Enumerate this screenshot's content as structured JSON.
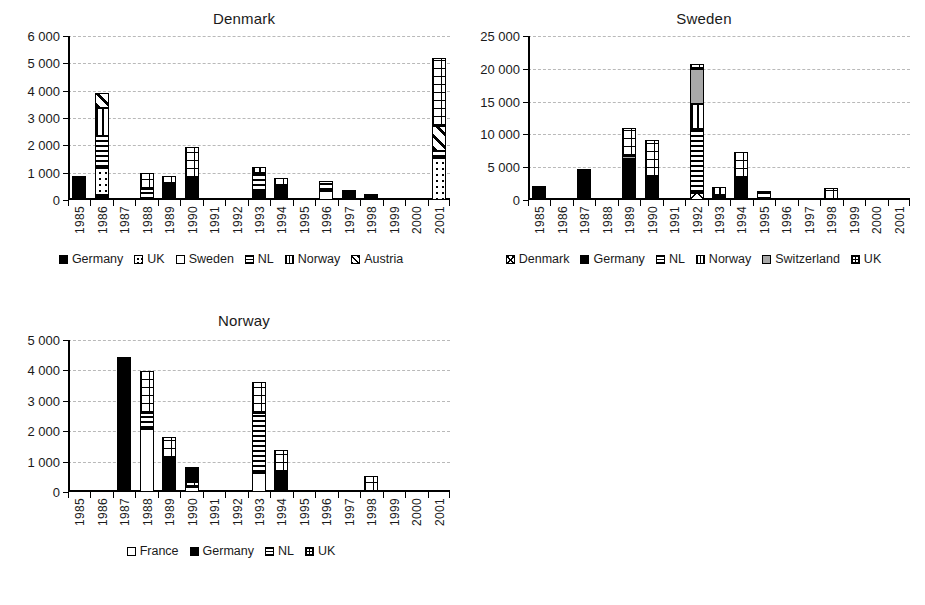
{
  "page": {
    "background": "#ffffff",
    "ink": "#1a1a1a",
    "gridline_color": "#b9b9b9",
    "gray_fill": "#a8a8a8"
  },
  "patterns": {
    "solid": "black-solid",
    "white": "white-empty",
    "gray": "gray-solid",
    "dots": "white-with-dots",
    "horiz": "horizontal-lines",
    "vert": "vertical-lines",
    "grid": "cross-grid",
    "diag": "diagonal-hatch",
    "diamond": "diamond-hatch"
  },
  "chart_data": [
    {
      "id": "denmark",
      "type": "bar",
      "stacked": true,
      "title": "Denmark",
      "xlabel": "",
      "ylabel": "",
      "ylim": [
        0,
        6000
      ],
      "yticks": [
        0,
        1000,
        2000,
        3000,
        4000,
        5000,
        6000
      ],
      "ytick_labels": [
        "0",
        "1 000",
        "2 000",
        "3 000",
        "4 000",
        "5 000",
        "6 000"
      ],
      "grid": true,
      "legend_position": "bottom",
      "categories": [
        "1985",
        "1986",
        "1987",
        "1988",
        "1989",
        "1990",
        "1991",
        "1992",
        "1993",
        "1994",
        "1995",
        "1996",
        "1997",
        "1998",
        "1999",
        "2000",
        "2001"
      ],
      "series": [
        {
          "name": "Germany",
          "pattern": "solid",
          "values": [
            880,
            180,
            0,
            0,
            590,
            800,
            0,
            0,
            290,
            500,
            0,
            0,
            280,
            130,
            0,
            0,
            0
          ]
        },
        {
          "name": "UK",
          "pattern": "dots",
          "values": [
            0,
            990,
            0,
            0,
            0,
            0,
            0,
            0,
            0,
            0,
            0,
            0,
            70,
            30,
            0,
            0,
            1520
          ]
        },
        {
          "name": "Sweden",
          "pattern": "white",
          "values": [
            0,
            0,
            0,
            0,
            0,
            0,
            0,
            0,
            0,
            0,
            0,
            320,
            0,
            0,
            0,
            0,
            0
          ]
        },
        {
          "name": "NL",
          "pattern": "horiz",
          "values": [
            0,
            1180,
            0,
            400,
            0,
            0,
            0,
            0,
            700,
            0,
            0,
            390,
            0,
            0,
            0,
            0,
            280
          ]
        },
        {
          "name": "Norway",
          "pattern": "vert",
          "values": [
            0,
            1000,
            0,
            0,
            0,
            0,
            0,
            0,
            210,
            0,
            0,
            0,
            0,
            0,
            0,
            0,
            0
          ]
        },
        {
          "name": "Austria",
          "pattern": "diag",
          "values": [
            0,
            580,
            0,
            0,
            0,
            0,
            0,
            0,
            0,
            0,
            0,
            0,
            0,
            0,
            0,
            0,
            900
          ]
        },
        {
          "name": "Other-grid",
          "pattern": "grid",
          "values": [
            0,
            0,
            0,
            600,
            300,
            1150,
            0,
            0,
            0,
            300,
            0,
            0,
            0,
            0,
            0,
            0,
            2500
          ]
        }
      ],
      "legend": [
        {
          "label": "Germany",
          "pattern": "solid"
        },
        {
          "label": "UK",
          "pattern": "dots"
        },
        {
          "label": "Sweden",
          "pattern": "white"
        },
        {
          "label": "NL",
          "pattern": "horiz"
        },
        {
          "label": "Norway",
          "pattern": "vert"
        },
        {
          "label": "Austria",
          "pattern": "diag"
        }
      ]
    },
    {
      "id": "sweden",
      "type": "bar",
      "stacked": true,
      "title": "Sweden",
      "xlabel": "",
      "ylabel": "",
      "ylim": [
        0,
        25000
      ],
      "yticks": [
        0,
        5000,
        10000,
        15000,
        20000,
        25000
      ],
      "ytick_labels": [
        "0",
        "5 000",
        "10 000",
        "15 000",
        "20 000",
        "25 000"
      ],
      "grid": true,
      "legend_position": "bottom",
      "categories": [
        "1985",
        "1986",
        "1987",
        "1988",
        "1989",
        "1990",
        "1991",
        "1992",
        "1993",
        "1994",
        "1995",
        "1996",
        "1997",
        "1998",
        "1999",
        "2000",
        "2001"
      ],
      "series": [
        {
          "name": "Denmark",
          "pattern": "diamond",
          "values": [
            0,
            0,
            0,
            0,
            0,
            0,
            0,
            1100,
            0,
            0,
            0,
            0,
            0,
            0,
            0,
            0,
            0
          ]
        },
        {
          "name": "Germany",
          "pattern": "solid",
          "values": [
            2200,
            0,
            4700,
            0,
            6300,
            3500,
            0,
            0,
            800,
            3300,
            0,
            0,
            0,
            0,
            0,
            0,
            0
          ]
        },
        {
          "name": "NL",
          "pattern": "horiz",
          "values": [
            0,
            0,
            0,
            0,
            0,
            0,
            0,
            9800,
            0,
            0,
            1400,
            0,
            0,
            0,
            0,
            0,
            0
          ]
        },
        {
          "name": "Norway",
          "pattern": "vert",
          "values": [
            0,
            0,
            0,
            0,
            0,
            0,
            0,
            3700,
            1200,
            0,
            0,
            0,
            0,
            0,
            0,
            0,
            0
          ]
        },
        {
          "name": "Switzerland",
          "pattern": "gray",
          "values": [
            0,
            0,
            0,
            0,
            400,
            0,
            0,
            5300,
            0,
            0,
            0,
            0,
            0,
            0,
            0,
            0,
            0
          ]
        },
        {
          "name": "UK",
          "pattern": "grid",
          "values": [
            0,
            0,
            0,
            0,
            4300,
            5600,
            0,
            900,
            0,
            4000,
            0,
            0,
            0,
            1900,
            0,
            0,
            0
          ]
        }
      ],
      "legend": [
        {
          "label": "Denmark",
          "pattern": "diamond"
        },
        {
          "label": "Germany",
          "pattern": "solid"
        },
        {
          "label": "NL",
          "pattern": "horiz"
        },
        {
          "label": "Norway",
          "pattern": "vert"
        },
        {
          "label": "Switzerland",
          "pattern": "gray"
        },
        {
          "label": "UK",
          "pattern": "grid"
        }
      ]
    },
    {
      "id": "norway",
      "type": "bar",
      "stacked": true,
      "title": "Norway",
      "xlabel": "",
      "ylabel": "",
      "ylim": [
        0,
        5000
      ],
      "yticks": [
        0,
        1000,
        2000,
        3000,
        4000,
        5000
      ],
      "ytick_labels": [
        "0",
        "1 000",
        "2 000",
        "3 000",
        "4 000",
        "5 000"
      ],
      "grid": true,
      "legend_position": "bottom",
      "categories": [
        "1985",
        "1986",
        "1987",
        "1988",
        "1989",
        "1990",
        "1991",
        "1992",
        "1993",
        "1994",
        "1995",
        "1996",
        "1997",
        "1998",
        "1999",
        "2000",
        "2001"
      ],
      "series": [
        {
          "name": "France",
          "pattern": "white",
          "values": [
            0,
            0,
            0,
            2080,
            0,
            170,
            0,
            0,
            620,
            0,
            0,
            0,
            0,
            0,
            0,
            0,
            0
          ]
        },
        {
          "name": "Germany",
          "pattern": "solid",
          "values": [
            0,
            0,
            4430,
            0,
            1120,
            0,
            0,
            0,
            0,
            660,
            0,
            0,
            0,
            0,
            0,
            0,
            0
          ]
        },
        {
          "name": "NL",
          "pattern": "horiz",
          "values": [
            0,
            0,
            0,
            520,
            0,
            0,
            0,
            0,
            1980,
            0,
            0,
            0,
            0,
            0,
            0,
            0,
            0
          ]
        },
        {
          "name": "UK",
          "pattern": "grid",
          "values": [
            0,
            0,
            0,
            1380,
            680,
            170,
            0,
            0,
            1020,
            720,
            0,
            0,
            0,
            520,
            0,
            0,
            0
          ]
        },
        {
          "name": "Germany2",
          "pattern": "solid",
          "values": [
            0,
            0,
            0,
            0,
            0,
            480,
            0,
            0,
            0,
            0,
            0,
            0,
            0,
            0,
            0,
            0,
            0
          ]
        }
      ],
      "legend": [
        {
          "label": "France",
          "pattern": "white"
        },
        {
          "label": "Germany",
          "pattern": "solid"
        },
        {
          "label": "NL",
          "pattern": "horiz"
        },
        {
          "label": "UK",
          "pattern": "grid"
        }
      ]
    }
  ]
}
